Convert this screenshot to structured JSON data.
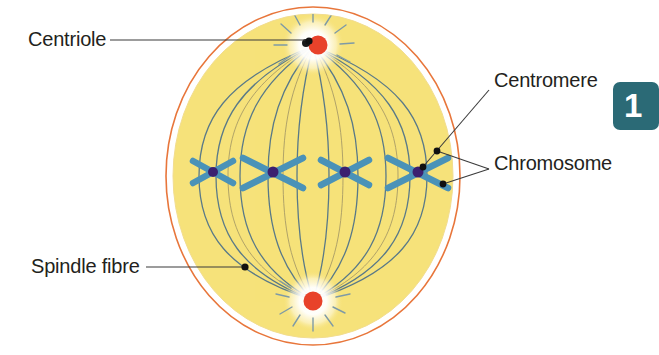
{
  "diagram": {
    "labels": {
      "centriole": "Centriole",
      "spindle_fibre": "Spindle fibre",
      "centromere": "Centromere",
      "chromosome": "Chromosome"
    },
    "badge": {
      "text": "1"
    },
    "colors": {
      "cytoplasm": "#f6e27a",
      "membrane_outline": "#e8763b",
      "spindle_fibre": "#5a7a88",
      "chromosome_arm": "#4a92b8",
      "centromere": "#3b2070",
      "centriole": "#e8422a",
      "label_text": "#231f20",
      "leader_line": "#3b3b3b",
      "badge": "#2b6a76",
      "background": "#ffffff"
    },
    "cell": {
      "center_x": 313,
      "center_y": 176,
      "radius_x": 142,
      "radius_y": 164
    },
    "centrioles": [
      {
        "name": "top-centriole",
        "x": 313,
        "y": 45
      },
      {
        "name": "bottom-centriole",
        "x": 313,
        "y": 300
      }
    ],
    "chromosomes": [
      {
        "name": "chromosome-1",
        "x": 213,
        "y": 172,
        "arm_length": 20
      },
      {
        "name": "chromosome-2",
        "x": 273,
        "y": 172,
        "arm_length": 30
      },
      {
        "name": "chromosome-3",
        "x": 345,
        "y": 172,
        "arm_length": 24
      },
      {
        "name": "chromosome-4",
        "x": 418,
        "y": 172,
        "arm_length": 30
      }
    ],
    "spindle_fibre_count": 11
  }
}
